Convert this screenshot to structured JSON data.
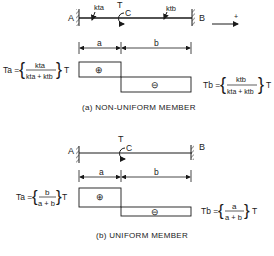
{
  "panels": [
    {
      "id": "a",
      "caption": "(a)  NON-UNIFORM  MEMBER",
      "support_left": "A",
      "support_right": "B",
      "torque_label": "T",
      "point_label": "C",
      "stiffness_left": "kta",
      "stiffness_right": "ktb",
      "dim_left": "a",
      "dim_right": "b",
      "positive_sign": "⊕",
      "negative_sign": "⊖",
      "direction_label": "+",
      "Ta": {
        "lhs": "Ta =",
        "num": "kta",
        "den": "kta + ktb",
        "rhs": "T"
      },
      "Tb": {
        "lhs": "Tb =",
        "num": "ktb",
        "den": "kta + ktb",
        "rhs": "T"
      }
    },
    {
      "id": "b",
      "caption": "(b)   UNIFORM  MEMBER",
      "support_left": "A",
      "support_right": "B",
      "torque_label": "T",
      "point_label": "C",
      "dim_left": "a",
      "dim_right": "b",
      "positive_sign": "⊕",
      "negative_sign": "⊖",
      "Ta": {
        "lhs": "Ta =",
        "num": "b",
        "den": "a + b",
        "rhs": "T"
      },
      "Tb": {
        "lhs": "Tb =",
        "num": "a",
        "den": "a + b",
        "rhs": "T"
      }
    }
  ]
}
